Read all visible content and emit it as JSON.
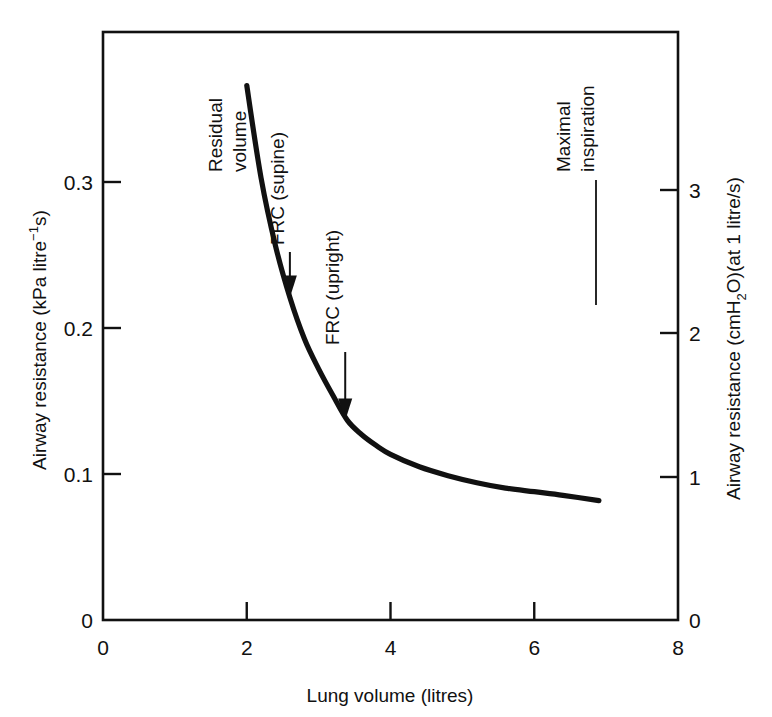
{
  "chart_data": {
    "type": "line",
    "title": "",
    "subtitle": "",
    "xlabel": "Lung volume (litres)",
    "ylabel": "Airway resistance (kPa litre⁻¹s)",
    "y2label": "Airway resistance (cmH₂O)(at 1 litre/s)",
    "xlim": [
      0,
      8
    ],
    "ylim": [
      0,
      0.33
    ],
    "y2lim": [
      0,
      3.37
    ],
    "grid": false,
    "legend": "none",
    "x_ticks": [
      0,
      2,
      4,
      6,
      8
    ],
    "x_tick_labels": [
      "0",
      "2",
      "4",
      "6",
      "8"
    ],
    "y_ticks": [
      0,
      0.1,
      0.2,
      0.3
    ],
    "y_tick_labels": [
      "0",
      "0.1",
      "0.2",
      "0.3"
    ],
    "y2_ticks": [
      0,
      1,
      2,
      3
    ],
    "y2_tick_labels": [
      "0",
      "1",
      "2",
      "3"
    ],
    "series": [
      {
        "name": "Airway resistance vs lung volume",
        "x": [
          2.0,
          2.2,
          2.4,
          2.6,
          2.8,
          3.0,
          3.2,
          3.4,
          3.6,
          3.8,
          4.0,
          4.4,
          4.8,
          5.2,
          5.6,
          6.0,
          6.4,
          6.9
        ],
        "y": [
          0.3,
          0.248,
          0.21,
          0.181,
          0.158,
          0.141,
          0.126,
          0.112,
          0.104,
          0.098,
          0.093,
          0.086,
          0.081,
          0.077,
          0.074,
          0.072,
          0.07,
          0.067
        ]
      }
    ],
    "annotations": [
      {
        "id": "residual-volume",
        "label": "Residual\nvolume",
        "lines": [
          "Residual",
          "volume"
        ],
        "x": 2.0,
        "y": 0.3,
        "marker": "none"
      },
      {
        "id": "frc-supine",
        "label": "FRC (supine)",
        "lines": [
          "FRC (supine)"
        ],
        "x": 2.6,
        "y": 0.181,
        "marker": "arrow"
      },
      {
        "id": "frc-upright",
        "label": "FRC (upright)",
        "lines": [
          "FRC (upright)"
        ],
        "x": 3.37,
        "y": 0.112,
        "marker": "arrow"
      },
      {
        "id": "maximal-inspiration",
        "label": "Maximal\ninspiration",
        "lines": [
          "Maximal",
          "inspiration"
        ],
        "x": 6.85,
        "y": 0.3,
        "marker": "line"
      }
    ]
  },
  "axes": {
    "left": {
      "title_main": "Airway resistance (kPa litre",
      "title_sup": "−1",
      "title_tail": "s)"
    },
    "right": {
      "title_head": "Airway resistance (cmH",
      "title_sub": "2",
      "title_tail": "O)(at 1 litre/s)"
    },
    "bottom": {
      "title": "Lung volume (litres)"
    }
  },
  "style": {
    "line_color": "#111111",
    "axis_color": "#111111",
    "background": "#ffffff"
  }
}
